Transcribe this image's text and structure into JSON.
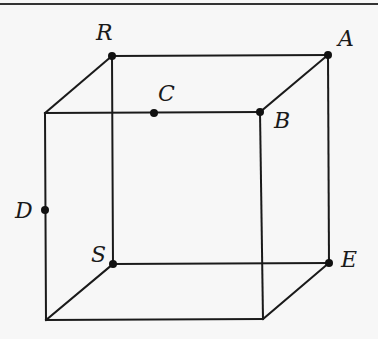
{
  "diagram": {
    "type": "cube",
    "colors": {
      "background": "#f7f7f7",
      "line": "#1a1a1a",
      "point": "#111111"
    },
    "vertices": {
      "R": {
        "x": 112,
        "y": 56
      },
      "A": {
        "x": 328,
        "y": 55
      },
      "S": {
        "x": 113,
        "y": 264
      },
      "E": {
        "x": 329,
        "y": 263
      },
      "front_top_left": {
        "x": 45,
        "y": 113
      },
      "B": {
        "x": 260,
        "y": 112
      },
      "front_bottom_left": {
        "x": 46,
        "y": 320
      },
      "front_bottom_right": {
        "x": 263,
        "y": 319
      }
    },
    "points": [
      {
        "id": "R",
        "label": "R",
        "x": 112,
        "y": 56,
        "label_x": 96,
        "label_y": 40
      },
      {
        "id": "A",
        "label": "A",
        "x": 328,
        "y": 55,
        "label_x": 338,
        "label_y": 46
      },
      {
        "id": "C",
        "label": "C",
        "x": 154,
        "y": 113,
        "label_x": 158,
        "label_y": 101
      },
      {
        "id": "B",
        "label": "B",
        "x": 260,
        "y": 112,
        "label_x": 274,
        "label_y": 128
      },
      {
        "id": "D",
        "label": "D",
        "x": 45,
        "y": 210,
        "label_x": 15,
        "label_y": 218
      },
      {
        "id": "S",
        "label": "S",
        "x": 113,
        "y": 264,
        "label_x": 91,
        "label_y": 262
      },
      {
        "id": "E",
        "label": "E",
        "x": 329,
        "y": 263,
        "label_x": 341,
        "label_y": 267
      }
    ],
    "labels": {
      "R": "R",
      "A": "A",
      "B": "B",
      "C": "C",
      "D": "D",
      "S": "S",
      "E": "E"
    }
  }
}
